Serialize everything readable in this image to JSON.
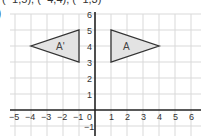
{
  "header": {
    "cropped_text": "(−1,5), (−4,4), (−1,3)",
    "part_label": ")"
  },
  "grid": {
    "x_ticks": [
      "−5",
      "−4",
      "−3",
      "−2",
      "−1",
      "0",
      "1",
      "2",
      "3",
      "4",
      "5",
      "6"
    ],
    "y_ticks": [
      "6",
      "5",
      "4",
      "3",
      "2",
      "1",
      "−1"
    ],
    "grid_color": "#d9d9d9",
    "axis_color": "#222222"
  },
  "shapes": [
    {
      "label": "A",
      "vertices": [
        [
          1,
          5
        ],
        [
          1,
          3
        ],
        [
          4,
          4
        ]
      ],
      "fill": "#e3e3e3",
      "stroke": "#333333"
    },
    {
      "label": "A'",
      "vertices": [
        [
          -1,
          5
        ],
        [
          -1,
          3
        ],
        [
          -4,
          4
        ]
      ],
      "fill": "#e3e3e3",
      "stroke": "#333333"
    }
  ]
}
